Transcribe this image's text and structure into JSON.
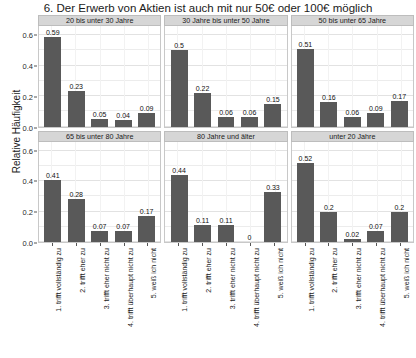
{
  "chart_data": {
    "type": "bar",
    "title": "6. Der Erwerb von Aktien ist auch mit nur 50€ oder 100€ möglich",
    "xlabel": "",
    "ylabel": "Relative Häufigkeit",
    "ylim": [
      0,
      0.66
    ],
    "yticks": [
      "0.0",
      "0.2",
      "0.4",
      "0.6"
    ],
    "ytick_values": [
      0.0,
      0.2,
      0.4,
      0.6
    ],
    "grid": true,
    "legend": "none",
    "layout": "facet grid 2 rows x 3 columns",
    "categories": [
      "1. trifft vollständig zu",
      "2. trifft eher zu",
      "3. trifft eher nicht zu",
      "4. trifft überhaupt nicht zu",
      "5. weiß ich nicht"
    ],
    "bar_color": "#595959",
    "strip_color": "#d6d6d6",
    "panels": [
      {
        "label": "20 bis unter 30 Jahre",
        "values": [
          0.59,
          0.23,
          0.05,
          0.04,
          0.09
        ],
        "value_labels": [
          "0.59",
          "0.23",
          "0.05",
          "0.04",
          "0.09"
        ]
      },
      {
        "label": "30 Jahre bis unter 50 Jahre",
        "values": [
          0.5,
          0.22,
          0.06,
          0.06,
          0.15
        ],
        "value_labels": [
          "0.5",
          "0.22",
          "0.06",
          "0.06",
          "0.15"
        ]
      },
      {
        "label": "50 bis unter 65 Jahre",
        "values": [
          0.51,
          0.16,
          0.06,
          0.09,
          0.17
        ],
        "value_labels": [
          "0.51",
          "0.16",
          "0.06",
          "0.09",
          "0.17"
        ]
      },
      {
        "label": "65 bis unter 80 Jahre",
        "values": [
          0.41,
          0.28,
          0.07,
          0.07,
          0.17
        ],
        "value_labels": [
          "0.41",
          "0.28",
          "0.07",
          "0.07",
          "0.17"
        ]
      },
      {
        "label": "80 Jahre und älter",
        "values": [
          0.44,
          0.11,
          0.11,
          0.0,
          0.33
        ],
        "value_labels": [
          "0.44",
          "0.11",
          "0.11",
          "0",
          "0.33"
        ]
      },
      {
        "label": "unter 20 Jahre",
        "values": [
          0.52,
          0.2,
          0.02,
          0.07,
          0.2
        ],
        "value_labels": [
          "0.52",
          "0.2",
          "0.02",
          "0.07",
          "0.2"
        ]
      }
    ]
  }
}
